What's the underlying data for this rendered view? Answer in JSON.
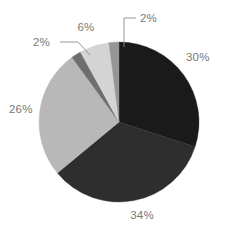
{
  "chart_data": {
    "type": "pie",
    "title": "",
    "subtitle": "",
    "xlabel": "",
    "ylabel": "",
    "grid": false,
    "legend": "none",
    "units": "percent",
    "start_angle_deg": 0,
    "direction": "clockwise",
    "center": {
      "x": 119,
      "y": 122
    },
    "radius": 80,
    "categories": [
      "30%",
      "34%",
      "26%",
      "2%",
      "6%",
      "2%"
    ],
    "values": [
      30,
      34,
      26,
      2,
      6,
      2
    ],
    "slices": [
      {
        "label": "30%",
        "value": 30,
        "color": "#1a1a1a",
        "start_deg": 0,
        "end_deg": 108,
        "label_x": 186,
        "label_y": 61,
        "label_anchor": "start",
        "leader": false
      },
      {
        "label": "34%",
        "value": 34,
        "color": "#2e2e2e",
        "start_deg": 108,
        "end_deg": 230.4,
        "label_x": 142,
        "label_y": 219,
        "label_anchor": "middle",
        "leader": false
      },
      {
        "label": "26%",
        "value": 26,
        "color": "#b8b8b8",
        "start_deg": 230.4,
        "end_deg": 324,
        "label_x": 9,
        "label_y": 113,
        "label_anchor": "start",
        "leader": false
      },
      {
        "label": "2%",
        "value": 2,
        "color": "#6e6e6e",
        "start_deg": 324,
        "end_deg": 331.2,
        "label_x": 33,
        "label_y": 46,
        "label_anchor": "start",
        "leader": true,
        "leader_path": "M 60 42 L 78 42 L 90 55"
      },
      {
        "label": "6%",
        "value": 6,
        "color": "#d4d4d4",
        "start_deg": 331.2,
        "end_deg": 352.8,
        "label_x": 86,
        "label_y": 31,
        "label_anchor": "middle",
        "leader": false
      },
      {
        "label": "2%",
        "value": 2,
        "color": "#969696",
        "start_deg": 352.8,
        "end_deg": 360,
        "label_x": 140,
        "label_y": 22,
        "label_anchor": "start",
        "leader": true,
        "leader_path": "M 136 18 L 124 18 L 124 47"
      }
    ]
  },
  "colors": {
    "background": "#ffffff",
    "label_text": "#787878",
    "leader_line": "#8a8a8a"
  }
}
